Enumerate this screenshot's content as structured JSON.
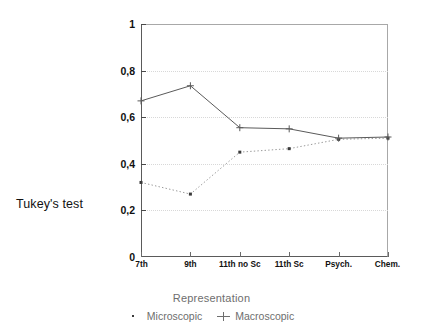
{
  "chart_data": {
    "type": "line",
    "title": "",
    "xlabel": "",
    "ylabel": "Tukey's test",
    "legend_title": "Representation",
    "legend_position": "bottom",
    "grid": true,
    "categories": [
      "7th",
      "9th",
      "11th no Sc",
      "11th Sc",
      "Psych.",
      "Chem."
    ],
    "ylim": [
      0,
      1
    ],
    "ytick_labels": [
      "1",
      "0,8",
      "0,6",
      "0,4",
      "0,2",
      "0"
    ],
    "ytick_values": [
      1,
      0.8,
      0.6,
      0.4,
      0.2,
      0
    ],
    "series": [
      {
        "name": "Microscopic",
        "marker": "dot",
        "line_style": "dotted",
        "color": "#9a9a9a",
        "values": [
          0.32,
          0.27,
          0.45,
          0.465,
          0.505,
          0.51
        ]
      },
      {
        "name": "Macroscopic",
        "marker": "plus",
        "line_style": "solid",
        "color": "#5a5a5a",
        "values": [
          0.67,
          0.735,
          0.555,
          0.55,
          0.51,
          0.515
        ]
      }
    ]
  },
  "axes": {
    "y_axis_label": "Tukey's test"
  },
  "legend": {
    "title": "Representation",
    "items": [
      {
        "label": "Microscopic",
        "marker": "dot-marker"
      },
      {
        "label": "Macroscopic",
        "marker": "plus-marker"
      }
    ]
  },
  "colors": {
    "microscopic": "#9a9a9a",
    "macroscopic": "#5a5a5a",
    "grid": "#d8d8d8",
    "axis": "#5a5a5a",
    "text": "#1a1a1a",
    "legend_text": "#6e6e6e"
  }
}
